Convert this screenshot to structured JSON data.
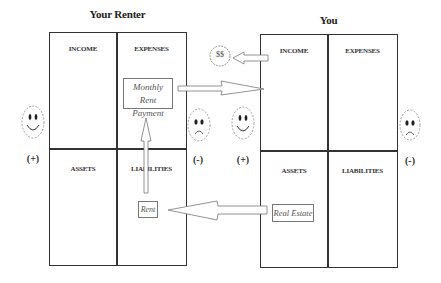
{
  "diagram": {
    "left_statement": {
      "title": "Your Renter",
      "cells": {
        "income": "INCOME",
        "expenses": "EXPENSES",
        "assets": "ASSETS",
        "liabilities": "LIABILITIES"
      },
      "items": {
        "expense_item_line1": "Monthly Rent",
        "expense_item_line2": "Payment",
        "liability_item": "Rent"
      },
      "positive_sign": "(+)",
      "negative_sign": "(-)"
    },
    "right_statement": {
      "title": "You",
      "cells": {
        "income": "INCOME",
        "expenses": "EXPENSES",
        "assets": "ASSETS",
        "liabilities": "LIABILITIES"
      },
      "items": {
        "asset_item": "Real Estate"
      },
      "positive_sign": "(+)",
      "negative_sign": "(-)"
    },
    "money_badge": "$$",
    "icons": {
      "left_positive": "happy-face-icon",
      "left_negative": "sad-face-icon",
      "right_positive": "happy-face-icon",
      "right_negative": "sad-face-icon"
    },
    "flows": [
      {
        "from": "right.assets.Real Estate",
        "to": "left.liabilities.Rent",
        "direction": "left"
      },
      {
        "from": "left.liabilities.Rent",
        "to": "left.expenses.Monthly Rent Payment",
        "direction": "up"
      },
      {
        "from": "left.expenses.Monthly Rent Payment",
        "to": "right.income",
        "direction": "right"
      },
      {
        "from": "right.income",
        "to": "$$",
        "direction": "left"
      }
    ],
    "colors": {
      "line": "#333333",
      "arrow": "#777777",
      "face": "#888888"
    }
  }
}
